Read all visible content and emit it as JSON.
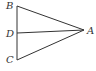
{
  "diagram": {
    "type": "geometry-triangle",
    "stroke_color": "#333333",
    "background": "#ffffff",
    "points": {
      "A": {
        "label": "A",
        "x": 84,
        "y": 30
      },
      "B": {
        "label": "B",
        "x": 17,
        "y": 6
      },
      "C": {
        "label": "C",
        "x": 17,
        "y": 60
      },
      "D": {
        "label": "D",
        "x": 17,
        "y": 33
      }
    },
    "segments": [
      "AB",
      "BC",
      "CA",
      "DA"
    ]
  }
}
